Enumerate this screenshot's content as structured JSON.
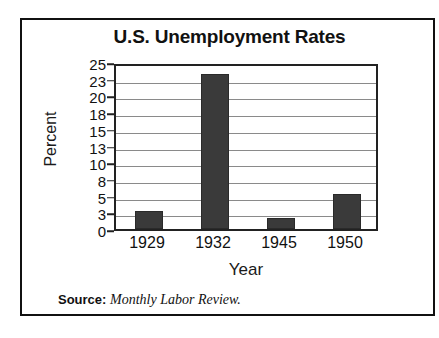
{
  "scan_artifact": {
    "top_ghost_text": "·  ·   ··   · ·   ···  · ··  ·   ·  ··  · ·"
  },
  "chart_data": {
    "type": "bar",
    "title": "U.S. Unemployment Rates",
    "xlabel": "Year",
    "ylabel": "Percent",
    "categories": [
      "1929",
      "1932",
      "1945",
      "1950"
    ],
    "values": [
      3.2,
      23.6,
      1.9,
      5.3
    ],
    "ylim": [
      0,
      25
    ],
    "ytick_labels": [
      "25",
      "23",
      "20",
      "18",
      "15",
      "13",
      "10",
      "8",
      "5",
      "3",
      "0"
    ],
    "ytick_values": [
      25,
      23,
      20,
      18,
      15,
      13,
      10,
      8,
      5,
      3,
      0
    ],
    "grid": true,
    "legend": "none",
    "bar_color": "#3a3a3a",
    "gridline_color": "#8a8a8a",
    "axis_color": "#222222",
    "frame_color": "#111111",
    "background": "#ffffff"
  },
  "source": {
    "label": "Source:",
    "value": "Monthly Labor Review."
  }
}
